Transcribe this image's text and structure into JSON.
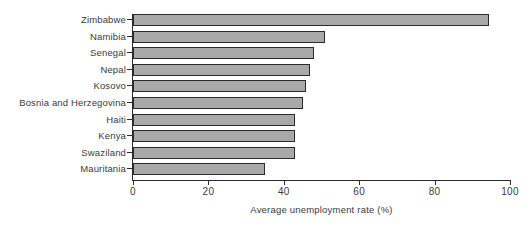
{
  "chart_data": {
    "type": "bar",
    "orientation": "horizontal",
    "title": "",
    "xlabel": "Average unemployment rate (%)",
    "ylabel": "",
    "xlim": [
      0,
      100
    ],
    "xticks": [
      0,
      20,
      40,
      60,
      80,
      100
    ],
    "grid": false,
    "legend": null,
    "bar_color": "#a9a9a9",
    "bar_edge_color": "#2b2b2b",
    "categories": [
      "Zimbabwe",
      "Namibia",
      "Senegal",
      "Nepal",
      "Kosovo",
      "Bosnia and Herzegovina",
      "Haiti",
      "Kenya",
      "Swaziland",
      "Mauritania"
    ],
    "values": [
      94.5,
      51,
      48,
      47,
      46,
      45,
      43,
      43,
      43,
      35
    ]
  }
}
